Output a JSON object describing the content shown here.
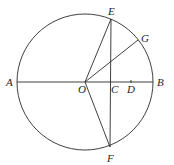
{
  "diagram": {
    "type": "geometry-circle",
    "circle": {
      "center": "O",
      "cx": 85,
      "cy": 82,
      "r": 68
    },
    "points": {
      "A": {
        "label": "A",
        "x": 17,
        "y": 82,
        "lx": 6,
        "ly": 86
      },
      "B": {
        "label": "B",
        "x": 153,
        "y": 82,
        "lx": 157,
        "ly": 86
      },
      "O": {
        "label": "O",
        "x": 85,
        "y": 82,
        "lx": 78,
        "ly": 93
      },
      "C": {
        "label": "C",
        "x": 110,
        "y": 82,
        "lx": 111,
        "ly": 93
      },
      "D": {
        "label": "D",
        "x": 131,
        "y": 82,
        "lx": 127,
        "ly": 93
      },
      "E": {
        "label": "E",
        "x": 111,
        "y": 19,
        "lx": 108,
        "ly": 15
      },
      "F": {
        "label": "F",
        "x": 110,
        "y": 147,
        "lx": 107,
        "ly": 162
      },
      "G": {
        "label": "G",
        "x": 138,
        "y": 40,
        "lx": 141,
        "ly": 42
      }
    },
    "segments": [
      [
        "A",
        "B"
      ],
      [
        "O",
        "E"
      ],
      [
        "O",
        "F"
      ],
      [
        "O",
        "G"
      ],
      [
        "E",
        "F"
      ]
    ],
    "stroke_color": "#2a2a2a"
  }
}
